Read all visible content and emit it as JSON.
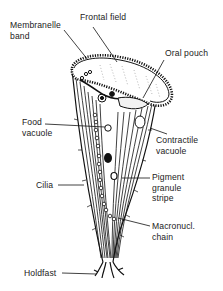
{
  "diagram": {
    "labels": {
      "membranelle_band_l1": "Membranelle",
      "membranelle_band_l2": "band",
      "frontal_field": "Frontal field",
      "oral_pouch": "Oral pouch",
      "food_vacuole_l1": "Food",
      "food_vacuole_l2": "vacuole",
      "contractile_vacuole_l1": "Contractile",
      "contractile_vacuole_l2": "vacuole",
      "cilia": "Cilia",
      "pigment_l1": "Pigment",
      "pigment_l2": "granule",
      "pigment_l3": "stripe",
      "macronucl_l1": "Macronucl.",
      "macronucl_l2": "chain",
      "holdfast": "Holdfast"
    },
    "colors": {
      "ink": "#111111",
      "background": "#ffffff"
    }
  }
}
